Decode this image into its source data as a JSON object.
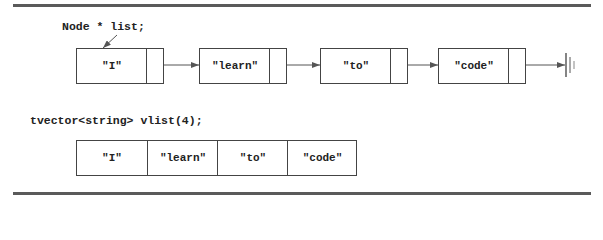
{
  "linked_list": {
    "declaration": "Node * list;",
    "nodes": [
      {
        "value": "\"I\""
      },
      {
        "value": "\"learn\""
      },
      {
        "value": "\"to\""
      },
      {
        "value": "\"code\""
      }
    ],
    "terminator": "null-ground-icon"
  },
  "vector": {
    "declaration": "tvector<string> vlist(4);",
    "cells": [
      "\"I\"",
      "\"learn\"",
      "\"to\"",
      "\"code\""
    ]
  },
  "colors": {
    "line": "#444444",
    "rule": "#5a5a5a",
    "text": "#222222"
  }
}
